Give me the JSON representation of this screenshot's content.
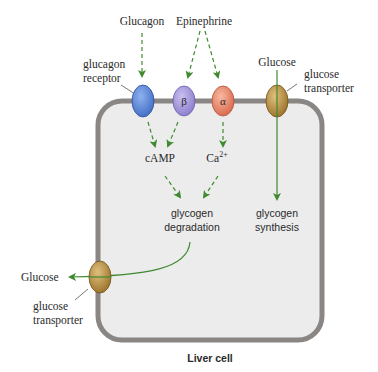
{
  "title": "Liver cell",
  "colors": {
    "membrane": "#8a8684",
    "cytoplasm": "#ececed",
    "arrow": "#3f8a2e",
    "glucagon_receptor": "#5b86d6",
    "beta_receptor": "#a395dc",
    "alpha_receptor": "#e78a6f",
    "transporter": "#b58a3c"
  },
  "signals": {
    "glucagon": "Glucagon",
    "epinephrine": "Epinephrine",
    "glucose_top": "Glucose",
    "glucose_bottom": "Glucose"
  },
  "receptors": {
    "glucagon_label_line1": "glucagon",
    "glucagon_label_line2": "receptor",
    "beta_symbol": "β",
    "alpha_symbol": "α"
  },
  "transporters": {
    "top_label_line1": "glucose",
    "top_label_line2": "transporter",
    "bottom_label_line1": "glucose",
    "bottom_label_line2": "transporter"
  },
  "messengers": {
    "camp": "cAMP",
    "calcium": "Ca",
    "calcium_charge": "2+"
  },
  "processes": {
    "degradation_line1": "glycogen",
    "degradation_line2": "degradation",
    "synthesis_line1": "glycogen",
    "synthesis_line2": "synthesis"
  },
  "caption": "Liver cell"
}
